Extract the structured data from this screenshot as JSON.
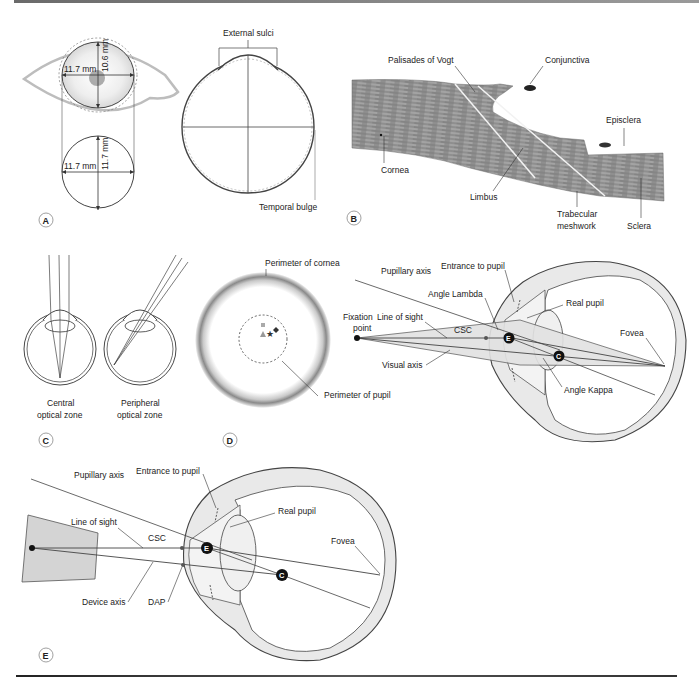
{
  "figure": {
    "panels": {
      "A": {
        "letter": "A",
        "labels": {
          "horizontal_diameter_top": "11.7 mm",
          "vertical_diameter_top": "10.6 mm",
          "horizontal_diameter_bottom": "11.7 mm",
          "vertical_diameter_bottom": "11.7 mm",
          "external_sulci": "External sulci",
          "temporal_bulge": "Temporal bulge"
        }
      },
      "B": {
        "letter": "B",
        "labels": {
          "palisades": "Palisades of Vogt",
          "conjunctiva": "Conjunctiva",
          "episclera": "Episclera",
          "cornea": "Cornea",
          "limbus": "Limbus",
          "trabecular_1": "Trabecular",
          "trabecular_2": "meshwork",
          "sclera": "Sclera"
        }
      },
      "C": {
        "letter": "C",
        "labels": {
          "central_1": "Central",
          "central_2": "optical zone",
          "peripheral_1": "Peripheral",
          "peripheral_2": "optical zone"
        }
      },
      "D": {
        "letter": "D",
        "labels": {
          "perimeter_cornea": "Perimeter of cornea",
          "perimeter_pupil": "Perimeter of pupil",
          "pupillary_axis": "Pupillary axis",
          "entrance_pupil": "Entrance to pupil",
          "angle_lambda": "Angle Lambda",
          "real_pupil": "Real pupil",
          "fixation_1": "Fixation",
          "fixation_2": "point",
          "line_of_sight": "Line of sight",
          "csc": "CSC",
          "fovea": "Fovea",
          "visual_axis": "Visual axis",
          "angle_kappa": "Angle Kappa",
          "marker_e": "E",
          "marker_c": "C"
        }
      },
      "E": {
        "letter": "E",
        "labels": {
          "pupillary_axis": "Pupillary axis",
          "entrance_pupil": "Entrance to pupil",
          "real_pupil": "Real pupil",
          "line_of_sight": "Line of sight",
          "csc": "CSC",
          "fovea": "Fovea",
          "device_axis": "Device axis",
          "dap": "DAP",
          "marker_e": "E",
          "marker_c": "C"
        }
      }
    },
    "colors": {
      "line": "#3a3a3a",
      "eyelid": "#b8b8b8",
      "fill_light": "#e6e6e6",
      "device": "#d4d4d4"
    }
  }
}
